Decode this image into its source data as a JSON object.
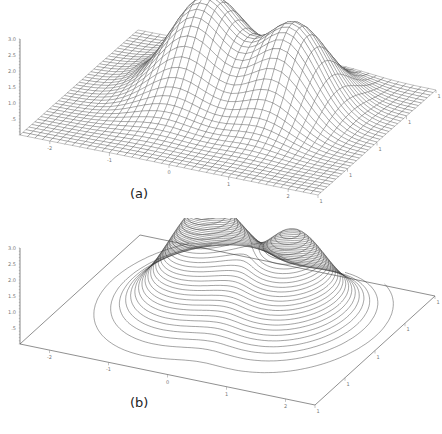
{
  "figure": {
    "panels": [
      {
        "id": "a",
        "caption": "(a)",
        "style": "wireframe"
      },
      {
        "id": "b",
        "caption": "(b)",
        "style": "contour"
      }
    ]
  },
  "chart_data": [
    {
      "type": "surface-wireframe",
      "title": "",
      "caption": "(a)",
      "z_axis": {
        "ticks": [
          ".5",
          "1.0",
          "1.5",
          "2.0",
          "2.5",
          "3.0"
        ],
        "range": [
          0,
          3.0
        ]
      },
      "x_axis": {
        "ticks": [
          "-2",
          "-1",
          "0",
          "1",
          "2"
        ],
        "range": [
          -2.5,
          2.5
        ]
      },
      "y_axis": {
        "ticks": [
          "-1",
          "0",
          "1"
        ],
        "range": [
          -1.5,
          1.5
        ]
      },
      "surface": {
        "description": "Sum of two Gaussian peaks over a flat plane",
        "peaks": [
          {
            "x": -0.6,
            "y": 0.35,
            "height": 3.0,
            "sigma": 0.55
          },
          {
            "x": 0.9,
            "y": 0.3,
            "height": 2.7,
            "sigma": 0.5
          }
        ]
      },
      "grid_lines": 40
    },
    {
      "type": "surface-contour",
      "title": "",
      "caption": "(b)",
      "z_axis": {
        "ticks": [
          ".5",
          "1.0",
          "1.5",
          "2.0",
          "2.5",
          "3.0"
        ],
        "range": [
          0,
          3.0
        ]
      },
      "x_axis": {
        "ticks": [
          "-2",
          "-1",
          "0",
          "1",
          "2"
        ],
        "range": [
          -2.5,
          2.5
        ]
      },
      "y_axis": {
        "ticks": [
          "-1",
          "0",
          "1"
        ],
        "range": [
          -1.5,
          1.5
        ]
      },
      "contour_levels": 28,
      "surface": {
        "description": "Same two-peak surface drawn with iso-height contour lines",
        "peaks": [
          {
            "x": -0.6,
            "y": 0.35,
            "height": 3.0,
            "sigma": 0.55
          },
          {
            "x": 0.9,
            "y": 0.3,
            "height": 2.7,
            "sigma": 0.5
          }
        ]
      }
    }
  ]
}
